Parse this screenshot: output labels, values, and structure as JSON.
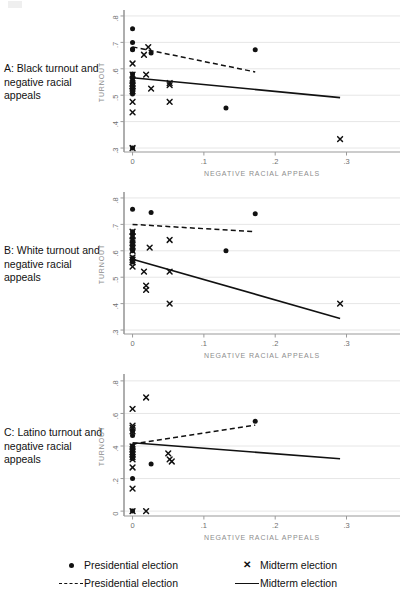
{
  "figure": {
    "background": "#ffffff",
    "axis_label_color": "#8d8d8d",
    "tick_color": "#6f6f6f",
    "grid_color": "#e6e6e6",
    "series_color": "#111111"
  },
  "panels": [
    {
      "id": "A",
      "caption": "A: Black turnout and negative racial appeals",
      "xlabel": "NEGATIVE RACIAL APPEALS",
      "ylabel": "TURNOUT"
    },
    {
      "id": "B",
      "caption": "B: White turnout and negative racial appeals",
      "xlabel": "NEGATIVE RACIAL APPEALS",
      "ylabel": "TURNOUT"
    },
    {
      "id": "C",
      "caption": "C: Latino turnout and negative racial appeals",
      "xlabel": "NEGATIVE RACIAL APPEALS",
      "ylabel": "TURNOUT"
    }
  ],
  "legend": {
    "items": [
      {
        "marker": "dot",
        "label": "Presidential election"
      },
      {
        "marker": "cross",
        "label": "Midterm election"
      },
      {
        "marker": "dash",
        "label": "Presidential election"
      },
      {
        "marker": "solid",
        "label": "Midterm election"
      }
    ]
  },
  "chart_data": [
    {
      "type": "scatter",
      "panel": "A",
      "title": "A: Black turnout and negative racial appeals",
      "xlabel": "NEGATIVE RACIAL APPEALS",
      "ylabel": "TURNOUT",
      "xlim": [
        -0.012,
        0.375
      ],
      "ylim": [
        0.285,
        0.815
      ],
      "xticks": [
        0,
        0.1,
        0.2,
        0.3
      ],
      "xticklabels": [
        "0",
        ".1",
        ".2",
        ".3"
      ],
      "yticks": [
        0.3,
        0.4,
        0.5,
        0.6,
        0.7,
        0.8
      ],
      "yticklabels": [
        ".3",
        ".4",
        ".5",
        ".6",
        ".7",
        ".8"
      ],
      "grid": "horizontal",
      "legend_position": "below-figure",
      "series": [
        {
          "name": "Presidential election",
          "marker": "dot",
          "points": [
            [
              0.0,
              0.752
            ],
            [
              0.0,
              0.7
            ],
            [
              0.0,
              0.675
            ],
            [
              0.0,
              0.672
            ],
            [
              0.0,
              0.58
            ],
            [
              0.0,
              0.568
            ],
            [
              0.0,
              0.556
            ],
            [
              0.0,
              0.548
            ],
            [
              0.0,
              0.54
            ],
            [
              0.0,
              0.53
            ],
            [
              0.0,
              0.522
            ],
            [
              0.0,
              0.512
            ],
            [
              0.0,
              0.505
            ],
            [
              0.0,
              0.3
            ],
            [
              0.026,
              0.66
            ],
            [
              0.131,
              0.452
            ],
            [
              0.172,
              0.672
            ]
          ]
        },
        {
          "name": "Midterm election",
          "marker": "cross",
          "points": [
            [
              0.0,
              0.62
            ],
            [
              0.0,
              0.578
            ],
            [
              0.0,
              0.556
            ],
            [
              0.0,
              0.545
            ],
            [
              0.0,
              0.535
            ],
            [
              0.0,
              0.525
            ],
            [
              0.0,
              0.515
            ],
            [
              0.0,
              0.475
            ],
            [
              0.0,
              0.435
            ],
            [
              0.0,
              0.3
            ],
            [
              0.016,
              0.653
            ],
            [
              0.019,
              0.578
            ],
            [
              0.022,
              0.682
            ],
            [
              0.026,
              0.525
            ],
            [
              0.052,
              0.546
            ],
            [
              0.052,
              0.538
            ],
            [
              0.052,
              0.475
            ],
            [
              0.291,
              0.334
            ]
          ]
        }
      ],
      "fit_lines": [
        {
          "name": "Presidential election",
          "style": "dashed",
          "x": [
            0.0,
            0.172
          ],
          "y": [
            0.683,
            0.588
          ]
        },
        {
          "name": "Midterm election",
          "style": "solid",
          "x": [
            0.0,
            0.291
          ],
          "y": [
            0.566,
            0.491
          ]
        }
      ]
    },
    {
      "type": "scatter",
      "panel": "B",
      "title": "B: White turnout and negative racial appeals",
      "xlabel": "NEGATIVE RACIAL APPEALS",
      "ylabel": "TURNOUT",
      "xlim": [
        -0.012,
        0.375
      ],
      "ylim": [
        0.285,
        0.815
      ],
      "xticks": [
        0,
        0.1,
        0.2,
        0.3
      ],
      "xticklabels": [
        "0",
        ".1",
        ".2",
        ".3"
      ],
      "yticks": [
        0.3,
        0.4,
        0.5,
        0.6,
        0.7,
        0.8
      ],
      "yticklabels": [
        ".3",
        ".4",
        ".5",
        ".6",
        ".7",
        ".8"
      ],
      "grid": "horizontal",
      "legend_position": "below-figure",
      "series": [
        {
          "name": "Presidential election",
          "marker": "dot",
          "points": [
            [
              0.0,
              0.757
            ],
            [
              0.0,
              0.672
            ],
            [
              0.0,
              0.663
            ],
            [
              0.0,
              0.65
            ],
            [
              0.0,
              0.637
            ],
            [
              0.0,
              0.626
            ],
            [
              0.0,
              0.617
            ],
            [
              0.0,
              0.608
            ],
            [
              0.0,
              0.6
            ],
            [
              0.0,
              0.573
            ],
            [
              0.0,
              0.566
            ],
            [
              0.0,
              0.558
            ],
            [
              0.026,
              0.745
            ],
            [
              0.131,
              0.6
            ],
            [
              0.172,
              0.74
            ]
          ]
        },
        {
          "name": "Midterm election",
          "marker": "cross",
          "points": [
            [
              0.0,
              0.672
            ],
            [
              0.0,
              0.655
            ],
            [
              0.0,
              0.64
            ],
            [
              0.0,
              0.628
            ],
            [
              0.0,
              0.613
            ],
            [
              0.0,
              0.6
            ],
            [
              0.0,
              0.575
            ],
            [
              0.0,
              0.566
            ],
            [
              0.0,
              0.556
            ],
            [
              0.0,
              0.54
            ],
            [
              0.016,
              0.521
            ],
            [
              0.019,
              0.468
            ],
            [
              0.019,
              0.452
            ],
            [
              0.024,
              0.612
            ],
            [
              0.052,
              0.641
            ],
            [
              0.052,
              0.521
            ],
            [
              0.052,
              0.4
            ],
            [
              0.291,
              0.4
            ]
          ]
        }
      ],
      "fit_lines": [
        {
          "name": "Presidential election",
          "style": "dashed",
          "x": [
            0.0,
            0.172
          ],
          "y": [
            0.7,
            0.672
          ]
        },
        {
          "name": "Midterm election",
          "style": "solid",
          "x": [
            0.0,
            0.291
          ],
          "y": [
            0.568,
            0.344
          ]
        }
      ]
    },
    {
      "type": "scatter",
      "panel": "C",
      "title": "C: Latino turnout and negative racial appeals",
      "xlabel": "NEGATIVE RACIAL APPEALS",
      "ylabel": "TURNOUT",
      "xlim": [
        -0.012,
        0.375
      ],
      "ylim": [
        -0.03,
        0.83
      ],
      "xticks": [
        0,
        0.1,
        0.2,
        0.3
      ],
      "xticklabels": [
        "0",
        ".1",
        ".2",
        ".3"
      ],
      "yticks": [
        0,
        0.2,
        0.4,
        0.6,
        0.8
      ],
      "yticklabels": [
        "0",
        ".2",
        ".4",
        ".6",
        ".8"
      ],
      "grid": "horizontal",
      "legend_position": "below-figure",
      "series": [
        {
          "name": "Presidential election",
          "marker": "dot",
          "points": [
            [
              0.0,
              0.49
            ],
            [
              0.0,
              0.465
            ],
            [
              0.0,
              0.4
            ],
            [
              0.0,
              0.378
            ],
            [
              0.0,
              0.355
            ],
            [
              0.0,
              0.34
            ],
            [
              0.0,
              0.325
            ],
            [
              0.0,
              0.2
            ],
            [
              0.0,
              0.0
            ],
            [
              0.026,
              0.29
            ],
            [
              0.172,
              0.552
            ]
          ]
        },
        {
          "name": "Midterm election",
          "marker": "cross",
          "points": [
            [
              0.0,
              0.628
            ],
            [
              0.0,
              0.525
            ],
            [
              0.0,
              0.512
            ],
            [
              0.0,
              0.49
            ],
            [
              0.0,
              0.398
            ],
            [
              0.0,
              0.38
            ],
            [
              0.0,
              0.362
            ],
            [
              0.0,
              0.348
            ],
            [
              0.0,
              0.332
            ],
            [
              0.0,
              0.318
            ],
            [
              0.0,
              0.268
            ],
            [
              0.0,
              0.138
            ],
            [
              0.0,
              0.0
            ],
            [
              0.019,
              0.698
            ],
            [
              0.019,
              0.0
            ],
            [
              0.05,
              0.355
            ],
            [
              0.052,
              0.318
            ],
            [
              0.055,
              0.305
            ]
          ]
        }
      ],
      "fit_lines": [
        {
          "name": "Presidential election",
          "style": "dashed",
          "x": [
            0.0,
            0.172
          ],
          "y": [
            0.412,
            0.528
          ]
        },
        {
          "name": "Midterm election",
          "style": "solid",
          "x": [
            0.0,
            0.291
          ],
          "y": [
            0.42,
            0.322
          ]
        }
      ]
    }
  ]
}
